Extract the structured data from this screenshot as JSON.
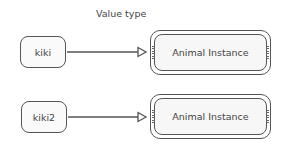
{
  "title": "Value type",
  "rows": [
    {
      "variable": "kiki",
      "instance": "Animal Instance"
    },
    {
      "variable": "kiki2",
      "instance": "Animal Instance"
    }
  ],
  "colors": {
    "stroke": "#555555",
    "text": "#444444",
    "fill": "#f7f7f7"
  }
}
